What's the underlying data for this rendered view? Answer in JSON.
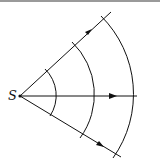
{
  "diagram": {
    "source_label": "S",
    "source": {
      "x": 20,
      "y": 96
    },
    "rays": [
      {
        "name": "upper",
        "end": {
          "x": 111,
          "y": 12
        },
        "arrow": {
          "x": 90,
          "y": 31
        }
      },
      {
        "name": "middle",
        "end": {
          "x": 137,
          "y": 96
        },
        "arrow": {
          "x": 114,
          "y": 96
        }
      },
      {
        "name": "lower",
        "end": {
          "x": 121,
          "y": 157
        },
        "arrow": {
          "x": 101,
          "y": 145
        }
      }
    ],
    "wavefront_radii": [
      37,
      73,
      110
    ],
    "colors": {
      "line": "#111111",
      "border": "#9a9a9a"
    }
  }
}
